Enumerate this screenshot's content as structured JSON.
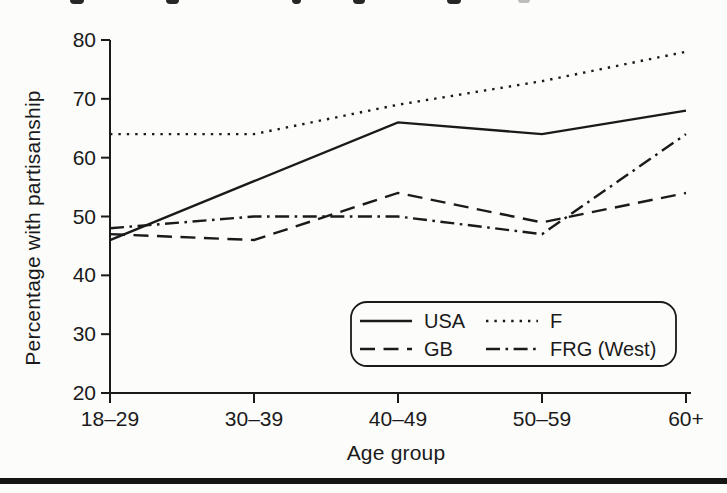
{
  "chart_data": {
    "type": "line",
    "categories": [
      "18–29",
      "30–39",
      "40–49",
      "50–59",
      "60+"
    ],
    "series": [
      {
        "name": "USA",
        "line_style": "solid",
        "values": [
          46,
          56,
          66,
          64,
          68
        ]
      },
      {
        "name": "GB",
        "line_style": "dashed",
        "values": [
          47,
          46,
          54,
          49,
          54
        ]
      },
      {
        "name": "F",
        "line_style": "dotted",
        "values": [
          64,
          64,
          69,
          73,
          78
        ]
      },
      {
        "name": "FRG (West)",
        "line_style": "dashdot",
        "values": [
          48,
          50,
          50,
          47,
          64
        ]
      }
    ],
    "xlabel": "Age group",
    "ylabel": "Percentage with partisanship",
    "ylim": [
      20,
      80
    ],
    "yticks": [
      20,
      30,
      40,
      50,
      60,
      70,
      80
    ],
    "grid": false,
    "legend_position": "inside-bottom-center-box",
    "line_color": "#1a1a1a"
  }
}
